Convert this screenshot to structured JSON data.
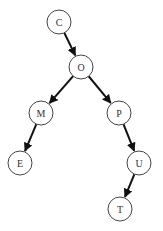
{
  "diagram": {
    "type": "tree",
    "nodes": [
      {
        "id": "C",
        "label": "C",
        "x": 59,
        "y": 22
      },
      {
        "id": "O",
        "label": "O",
        "x": 81,
        "y": 67
      },
      {
        "id": "M",
        "label": "M",
        "x": 41,
        "y": 113
      },
      {
        "id": "P",
        "label": "P",
        "x": 119,
        "y": 113
      },
      {
        "id": "E",
        "label": "E",
        "x": 20,
        "y": 163
      },
      {
        "id": "U",
        "label": "U",
        "x": 139,
        "y": 163
      },
      {
        "id": "T",
        "label": "T",
        "x": 120,
        "y": 209
      }
    ],
    "edges": [
      {
        "from": "C",
        "to": "O"
      },
      {
        "from": "O",
        "to": "M"
      },
      {
        "from": "O",
        "to": "P"
      },
      {
        "from": "M",
        "to": "E"
      },
      {
        "from": "P",
        "to": "U"
      },
      {
        "from": "U",
        "to": "T"
      }
    ],
    "node_radius": 12,
    "colors": {
      "stroke": "#444444",
      "edge": "#111111",
      "text": "#333333"
    }
  }
}
